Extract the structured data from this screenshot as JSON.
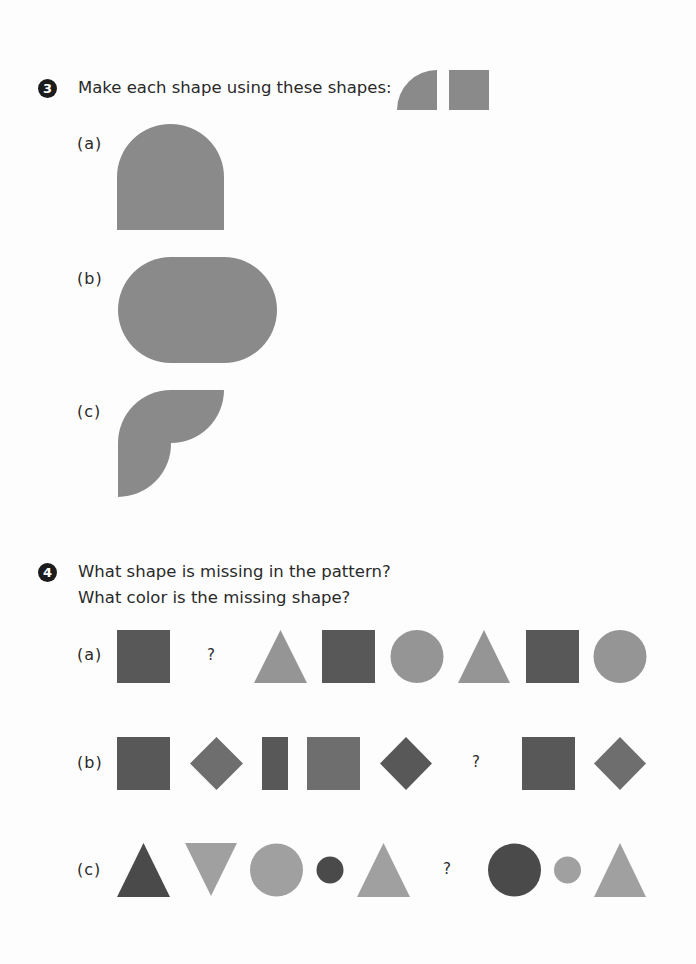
{
  "colors": {
    "dark": "#585858",
    "medium": "#6e6e6e",
    "light": "#959595",
    "fill": "#8a8a8a",
    "badge": "#1c1c1c"
  },
  "question3": {
    "number": "3",
    "prompt": "Make each shape using these shapes:",
    "reference_shapes": [
      "quarter-circle",
      "square"
    ],
    "parts": [
      {
        "label": "(a)",
        "shape": "arch (square with semicircle top)"
      },
      {
        "label": "(b)",
        "shape": "stadium (rounded rectangle)"
      },
      {
        "label": "(c)",
        "shape": "leaf-like composite of quarter circles"
      }
    ]
  },
  "question4": {
    "number": "4",
    "prompt_line1": "What shape is missing in the pattern?",
    "prompt_line2": "What color is the missing shape?",
    "missing_mark": "?",
    "rows": [
      {
        "label": "(a)",
        "items": [
          "dark square",
          "?",
          "light triangle",
          "dark square",
          "light circle",
          "light triangle",
          "dark square",
          "light circle"
        ]
      },
      {
        "label": "(b)",
        "items": [
          "dark square",
          "medium diamond",
          "dark rectangle",
          "medium square",
          "dark diamond",
          "?",
          "dark square",
          "medium diamond"
        ]
      },
      {
        "label": "(c)",
        "items": [
          "dark triangle",
          "light inverted triangle",
          "light circle",
          "small dark circle",
          "light triangle",
          "?",
          "dark circle",
          "small light circle",
          "light triangle"
        ]
      }
    ]
  }
}
